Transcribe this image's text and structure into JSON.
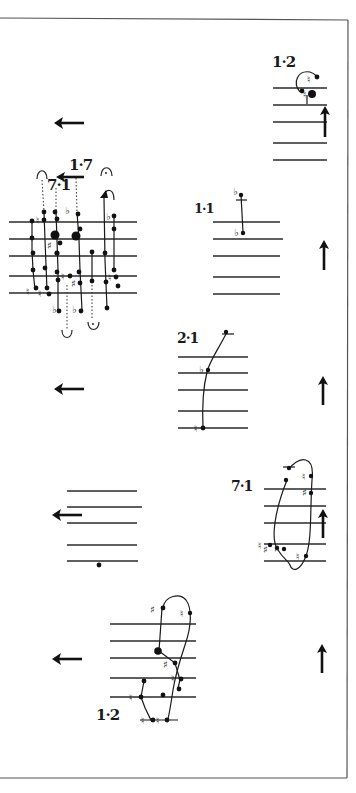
{
  "page": {
    "background": "#ffffff",
    "ink": "#111111"
  },
  "labels": {
    "top_right": "1·2",
    "cluster_a": "1·7",
    "cluster_b": "7·1",
    "middle_right": "1·1",
    "center": "2·1",
    "lower_right": "7·1",
    "bottom_left": "1·2"
  },
  "accidentals": {
    "flat": "♭",
    "natural": "♮",
    "sharp": "♯"
  },
  "arrows": [
    {
      "direction": "left",
      "position": "upper-left"
    },
    {
      "direction": "left",
      "position": "cluster-top"
    },
    {
      "direction": "up",
      "position": "top-right"
    },
    {
      "direction": "up",
      "position": "middle-right"
    },
    {
      "direction": "left",
      "position": "middle-left"
    },
    {
      "direction": "up",
      "position": "center-right"
    },
    {
      "direction": "left",
      "position": "lower-left"
    },
    {
      "direction": "up",
      "position": "lower-right"
    },
    {
      "direction": "left",
      "position": "bottom-left"
    },
    {
      "direction": "up",
      "position": "bottom-right"
    }
  ],
  "staves": [
    {
      "name": "top-right-staff",
      "lines": 5
    },
    {
      "name": "cluster-staff",
      "lines": 5
    },
    {
      "name": "middle-right-staff",
      "lines": 5
    },
    {
      "name": "center-staff",
      "lines": 5
    },
    {
      "name": "lower-left-staff",
      "lines": 5
    },
    {
      "name": "lower-right-staff",
      "lines": 5
    },
    {
      "name": "bottom-staff",
      "lines": 5
    }
  ]
}
